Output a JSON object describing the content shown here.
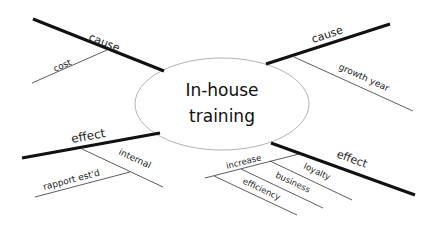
{
  "diagram": {
    "type": "fishbone-mindmap",
    "center": {
      "line1": "In-house",
      "line2": "training"
    },
    "branches": [
      {
        "id": "cause-top-left",
        "label": "cause",
        "sub": [
          "cost"
        ]
      },
      {
        "id": "cause-top-right",
        "label": "cause",
        "sub": [
          "growth year"
        ]
      },
      {
        "id": "effect-bottom-left",
        "label": "effect",
        "sub": [
          "internal",
          "rapport est'd"
        ]
      },
      {
        "id": "effect-bottom-right",
        "label": "effect",
        "sub": [
          "increase",
          "loyalty",
          "business",
          "efficiency"
        ]
      }
    ]
  },
  "colors": {
    "stroke": "#111111",
    "thin": "#333333",
    "ellipse": "#999999"
  }
}
